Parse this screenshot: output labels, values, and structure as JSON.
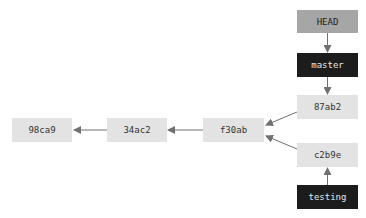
{
  "diagram": {
    "type": "git-branch-graph",
    "colors": {
      "commit_fill": "#e3e3e3",
      "branch_fill": "#1c1c1c",
      "head_fill": "#a6a6a6",
      "arrow": "#707070"
    },
    "pointers": {
      "head": "HEAD",
      "master": "master",
      "testing": "testing"
    },
    "commits": {
      "c1": "98ca9",
      "c2": "34ac2",
      "c3": "f30ab",
      "c4": "87ab2",
      "c5": "c2b9e"
    },
    "edges": [
      {
        "from": "HEAD",
        "to": "master"
      },
      {
        "from": "master",
        "to": "87ab2"
      },
      {
        "from": "87ab2",
        "to": "f30ab"
      },
      {
        "from": "c2b9e",
        "to": "f30ab"
      },
      {
        "from": "testing",
        "to": "c2b9e"
      },
      {
        "from": "f30ab",
        "to": "34ac2"
      },
      {
        "from": "34ac2",
        "to": "98ca9"
      }
    ]
  }
}
